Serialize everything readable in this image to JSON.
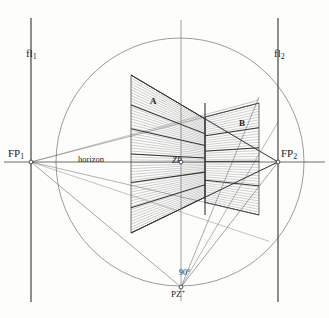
{
  "figure": {
    "type": "two-point-perspective-construction",
    "canvas": {
      "width": 329,
      "height": 318,
      "background": "#fdfdfc"
    },
    "ink": {
      "line": "#5a5a5a",
      "hatch": "#6e6e6e",
      "heavy": "#1f1f1f",
      "text": "#1d1d1d"
    }
  },
  "labels": {
    "vanishing_line_left": "fl",
    "vanishing_line_left_sub": "1",
    "vanishing_line_right": "fl",
    "vanishing_line_right_sub": "2",
    "focus_point_left": "FP",
    "focus_point_left_sub": "1",
    "focus_point_right": "FP",
    "focus_point_right_sub": "2",
    "horizon": "horizon",
    "center_point": "ZP",
    "plane_a": "A",
    "plane_b": "B",
    "right_angle": "90°",
    "station_point": "PZ",
    "station_point_sup": "+"
  },
  "geometry": {
    "horizon_y": 162,
    "center_x": 181,
    "circle": {
      "cx": 180,
      "cy": 162,
      "r": 124
    },
    "fp_left": {
      "x": 31,
      "y": 162
    },
    "fp_right": {
      "x": 278,
      "y": 162
    },
    "station_point": {
      "x": 181,
      "y": 287
    },
    "vertical_left_x": 31,
    "vertical_right_x": 278,
    "panel_a": {
      "left_x": 131,
      "top_y": 75,
      "bottom_y": 233,
      "edge_x": 205
    },
    "panel_b": {
      "edge_x": 205,
      "right_x": 259,
      "top_y": 103,
      "bottom_y": 215
    },
    "corner_edge": {
      "x": 205,
      "top_y": 103,
      "bottom_y": 215
    },
    "hatch_count_a": 54,
    "hatch_count_b": 40
  }
}
